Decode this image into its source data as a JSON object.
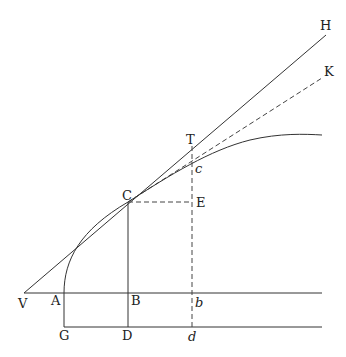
{
  "diagram": {
    "labels": {
      "H": "H",
      "K": "K",
      "T": "T",
      "c": "c",
      "C": "C",
      "E": "E",
      "V": "V",
      "A": "A",
      "B": "B",
      "b": "b",
      "G": "G",
      "D": "D",
      "d": "d"
    },
    "points": {
      "V": [
        24,
        293
      ],
      "A": [
        64,
        293
      ],
      "B": [
        128,
        293
      ],
      "b": [
        192,
        293
      ],
      "G": [
        64,
        327
      ],
      "D": [
        128,
        327
      ],
      "d": [
        192,
        327
      ],
      "C": [
        128,
        202
      ],
      "E": [
        192,
        202
      ],
      "T": [
        192,
        146
      ],
      "c": [
        192,
        164
      ],
      "H": [
        326,
        35
      ],
      "K": [
        322,
        78
      ]
    },
    "colors": {
      "line": "#333333",
      "background": "#ffffff"
    }
  }
}
